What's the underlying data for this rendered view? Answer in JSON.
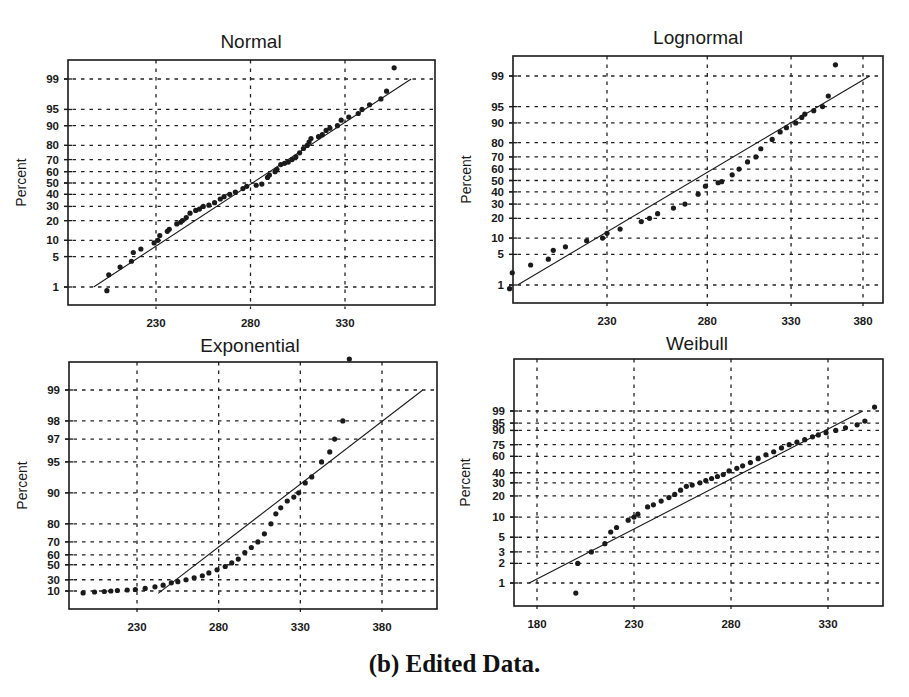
{
  "caption": "(b) Edited Data.",
  "chart_data": [
    {
      "type": "scatter",
      "title": "Normal",
      "xlabel": "",
      "ylabel": "Percent",
      "grid": true,
      "xticks": [
        230,
        280,
        330
      ],
      "yticks": [
        1,
        5,
        10,
        20,
        30,
        40,
        50,
        60,
        70,
        80,
        90,
        95,
        99
      ],
      "xlim": [
        192,
        370
      ],
      "fit_line": {
        "x": [
          197,
          365
        ],
        "y": [
          1,
          99
        ]
      },
      "series": [
        {
          "name": "data",
          "x": [
            204,
            205,
            211,
            217,
            218,
            222,
            229,
            231,
            232,
            236,
            237,
            241,
            243,
            244,
            246,
            248,
            251,
            253,
            255,
            258,
            261,
            264,
            266,
            269,
            272,
            276,
            278,
            283,
            286,
            289,
            290,
            293,
            294,
            296,
            298,
            300,
            302,
            304,
            306,
            308,
            310,
            311,
            312,
            316,
            318,
            320,
            322,
            326,
            328,
            332,
            337,
            339,
            343,
            349,
            352,
            356
          ],
          "y": [
            0.8,
            2,
            3,
            4,
            6,
            7,
            9,
            10,
            12,
            14,
            15,
            18,
            19,
            20,
            22,
            25,
            27,
            28,
            30,
            31,
            33,
            36,
            38,
            40,
            42,
            45,
            47,
            48,
            49,
            55,
            57,
            60,
            62,
            66,
            67,
            68,
            70,
            72,
            75,
            78,
            80,
            82,
            84,
            85,
            86,
            88,
            89,
            90,
            92,
            93,
            94,
            95,
            96,
            97,
            98,
            99.5
          ]
        }
      ]
    },
    {
      "type": "scatter",
      "title": "Lognormal",
      "xlabel": "",
      "ylabel": "Percent",
      "grid": true,
      "xticks": [
        230,
        280,
        330,
        380
      ],
      "yticks": [
        1,
        5,
        10,
        20,
        30,
        40,
        50,
        60,
        70,
        80,
        90,
        95,
        99
      ],
      "xlim": [
        183,
        390
      ],
      "fit_line": {
        "x": [
          193,
          385
        ],
        "y": [
          1,
          99
        ]
      },
      "series": [
        {
          "name": "data",
          "x": [
            190,
            191,
            198,
            205,
            207,
            212,
            221,
            228,
            230,
            236,
            246,
            250,
            254,
            262,
            268,
            275,
            279,
            286,
            288,
            294,
            298,
            303,
            308,
            311,
            318,
            323,
            327,
            333,
            337,
            339,
            345,
            351,
            355,
            360
          ],
          "y": [
            0.8,
            2,
            3,
            4,
            6,
            7,
            9,
            10,
            12,
            14,
            18,
            20,
            23,
            27,
            30,
            38,
            45,
            48,
            49,
            55,
            60,
            66,
            70,
            76,
            82,
            86,
            88,
            90,
            92,
            93,
            94,
            95,
            97,
            99.5
          ]
        }
      ]
    },
    {
      "type": "scatter",
      "title": "Exponential",
      "xlabel": "",
      "ylabel": "Percent",
      "grid": true,
      "xticks": [
        230,
        280,
        330,
        380
      ],
      "yticks": [
        10,
        30,
        50,
        60,
        70,
        80,
        90,
        95,
        97,
        98,
        99
      ],
      "xlim": [
        190,
        412
      ],
      "fit_line": {
        "x": [
          243,
          405
        ],
        "y": [
          5,
          99
        ]
      },
      "series": [
        {
          "name": "data",
          "x": [
            197,
            204,
            210,
            214,
            218,
            224,
            229,
            235,
            241,
            246,
            251,
            255,
            260,
            265,
            270,
            274,
            279,
            284,
            288,
            292,
            296,
            300,
            304,
            308,
            312,
            315,
            318,
            322,
            326,
            329,
            333,
            337,
            343,
            348,
            351,
            356,
            360
          ],
          "y": [
            6,
            8,
            9,
            10,
            11,
            12,
            13,
            15,
            18,
            21,
            25,
            27,
            30,
            33,
            36,
            40,
            44,
            48,
            52,
            56,
            62,
            66,
            70,
            75,
            80,
            84,
            86,
            88,
            89,
            90,
            92,
            93,
            95,
            96,
            97,
            98,
            99.5
          ]
        }
      ]
    },
    {
      "type": "scatter",
      "title": "Weibull",
      "xlabel": "",
      "ylabel": "Percent",
      "grid": true,
      "xticks": [
        180,
        230,
        280,
        330
      ],
      "yticks": [
        1,
        2,
        3,
        5,
        10,
        20,
        30,
        40,
        60,
        75,
        90,
        95,
        99
      ],
      "xlim": [
        170,
        361
      ],
      "fit_line": {
        "x": [
          176,
          348
        ],
        "y": [
          1,
          99
        ]
      },
      "series": [
        {
          "name": "data",
          "x": [
            200,
            201,
            208,
            215,
            218,
            221,
            227,
            230,
            232,
            237,
            240,
            244,
            248,
            251,
            254,
            257,
            260,
            264,
            267,
            270,
            273,
            276,
            279,
            283,
            286,
            290,
            294,
            298,
            302,
            306,
            310,
            314,
            318,
            322,
            325,
            329,
            334,
            339,
            345,
            349,
            354
          ],
          "y": [
            0.7,
            2,
            3,
            4,
            6,
            7,
            9,
            10,
            11,
            14,
            15,
            17,
            19,
            21,
            24,
            27,
            28,
            30,
            32,
            34,
            36,
            38,
            42,
            45,
            48,
            52,
            57,
            62,
            66,
            71,
            75,
            78,
            81,
            84,
            86,
            88,
            90,
            92,
            94,
            96,
            99.5
          ]
        }
      ]
    }
  ]
}
